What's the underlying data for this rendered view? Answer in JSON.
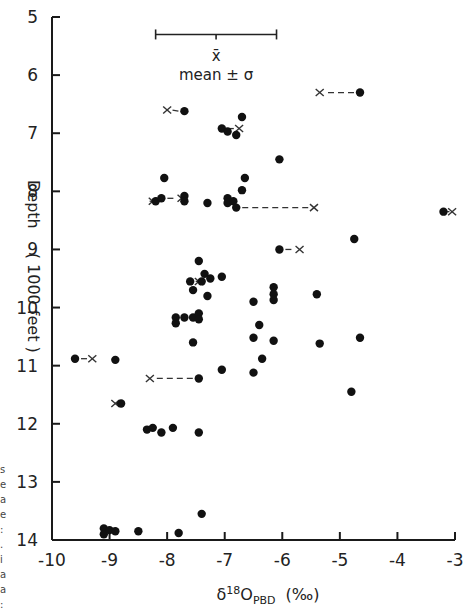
{
  "chart_data": {
    "type": "scatter",
    "title": "",
    "xlabel": "δ18O PBD (‰)",
    "xlabel_parts": {
      "delta": "δ",
      "sup": "18",
      "base": "O",
      "sub": "PBD",
      "unit": "(‰)"
    },
    "ylabel": "Depth (1000 feet)",
    "ylabel_parts": {
      "word": "Depth",
      "unit": "( 1000 feet )"
    },
    "xlim": [
      -10,
      -3
    ],
    "ylim": [
      5,
      14
    ],
    "y_inverted": true,
    "grid": false,
    "x_ticks": [
      -10,
      -9,
      -8,
      -7,
      -6,
      -5,
      -4,
      -3
    ],
    "x_tick_labels": [
      "-10",
      "-9",
      "-8",
      "-7",
      "-6",
      "-5",
      "-4",
      "-3"
    ],
    "y_ticks": [
      5,
      6,
      7,
      8,
      9,
      10,
      11,
      12,
      13,
      14
    ],
    "y_tick_labels": [
      "5",
      "6",
      "7",
      "8",
      "9",
      "10",
      "11",
      "12",
      "13",
      "14"
    ],
    "legend": {
      "mean_symbol": "x̄",
      "label": "mean ± σ",
      "bar_x_range": [
        -8.2,
        -6.1
      ],
      "bar_mean": -7.15,
      "bar_depth": 5.3
    },
    "series": [
      {
        "name": "measured",
        "marker": "filled-circle",
        "points": [
          [
            -7.7,
            6.62
          ],
          [
            -4.65,
            6.3
          ],
          [
            -7.05,
            6.92
          ],
          [
            -6.95,
            6.97
          ],
          [
            -6.8,
            7.03
          ],
          [
            -6.7,
            6.72
          ],
          [
            -6.05,
            7.45
          ],
          [
            -8.05,
            7.77
          ],
          [
            -6.65,
            7.77
          ],
          [
            -6.7,
            7.98
          ],
          [
            -8.2,
            8.17
          ],
          [
            -8.1,
            8.12
          ],
          [
            -7.7,
            8.08
          ],
          [
            -7.7,
            8.17
          ],
          [
            -7.3,
            8.2
          ],
          [
            -6.95,
            8.12
          ],
          [
            -6.95,
            8.2
          ],
          [
            -6.85,
            8.17
          ],
          [
            -6.8,
            8.28
          ],
          [
            -3.2,
            8.35
          ],
          [
            -6.05,
            9.0
          ],
          [
            -4.75,
            8.82
          ],
          [
            -7.45,
            9.2
          ],
          [
            -7.35,
            9.42
          ],
          [
            -7.25,
            9.5
          ],
          [
            -7.05,
            9.47
          ],
          [
            -7.4,
            9.55
          ],
          [
            -7.6,
            9.55
          ],
          [
            -7.55,
            9.7
          ],
          [
            -7.3,
            9.8
          ],
          [
            -6.5,
            9.9
          ],
          [
            -6.15,
            9.65
          ],
          [
            -6.15,
            9.77
          ],
          [
            -6.15,
            9.87
          ],
          [
            -5.4,
            9.77
          ],
          [
            -7.85,
            10.17
          ],
          [
            -7.85,
            10.27
          ],
          [
            -7.7,
            10.17
          ],
          [
            -7.55,
            10.17
          ],
          [
            -7.45,
            10.1
          ],
          [
            -7.45,
            10.2
          ],
          [
            -6.4,
            10.3
          ],
          [
            -7.55,
            10.6
          ],
          [
            -6.5,
            10.52
          ],
          [
            -6.15,
            10.57
          ],
          [
            -5.35,
            10.62
          ],
          [
            -4.65,
            10.52
          ],
          [
            -7.05,
            11.07
          ],
          [
            -6.5,
            11.12
          ],
          [
            -6.35,
            10.88
          ],
          [
            -9.6,
            10.88
          ],
          [
            -8.9,
            10.9
          ],
          [
            -7.45,
            11.22
          ],
          [
            -4.8,
            11.45
          ],
          [
            -8.8,
            11.65
          ],
          [
            -8.35,
            12.1
          ],
          [
            -8.25,
            12.07
          ],
          [
            -8.1,
            12.15
          ],
          [
            -7.9,
            12.07
          ],
          [
            -7.45,
            12.15
          ],
          [
            -7.4,
            13.55
          ],
          [
            -9.1,
            13.8
          ],
          [
            -9.1,
            13.9
          ],
          [
            -9.0,
            13.83
          ],
          [
            -8.9,
            13.85
          ],
          [
            -8.5,
            13.85
          ],
          [
            -7.8,
            13.88
          ]
        ]
      },
      {
        "name": "corrected (x) linked to measured by dashed line",
        "marker": "x",
        "links": [
          {
            "from": [
              -7.7,
              6.62
            ],
            "to": [
              -8.0,
              6.6
            ]
          },
          {
            "from": [
              -4.65,
              6.3
            ],
            "to": [
              -5.35,
              6.3
            ]
          },
          {
            "from": [
              -7.05,
              6.92
            ],
            "to": [
              -6.75,
              6.92
            ]
          },
          {
            "from": [
              -8.1,
              8.12
            ],
            "to": [
              -7.75,
              8.12
            ]
          },
          {
            "from": [
              -8.2,
              8.17
            ],
            "to": [
              -8.25,
              8.17
            ]
          },
          {
            "from": [
              -6.8,
              8.28
            ],
            "to": [
              -5.45,
              8.28
            ]
          },
          {
            "from": [
              -3.2,
              8.35
            ],
            "to": [
              -3.05,
              8.35
            ]
          },
          {
            "from": [
              -6.05,
              9.0
            ],
            "to": [
              -5.7,
              9.0
            ]
          },
          {
            "from": [
              -7.4,
              9.55
            ],
            "to": [
              -7.45,
              9.55
            ]
          },
          {
            "from": [
              -9.6,
              10.88
            ],
            "to": [
              -9.3,
              10.88
            ]
          },
          {
            "from": [
              -7.45,
              11.22
            ],
            "to": [
              -8.3,
              11.22
            ]
          },
          {
            "from": [
              -8.8,
              11.65
            ],
            "to": [
              -8.9,
              11.65
            ]
          }
        ]
      }
    ]
  },
  "margin_text": [
    "s",
    "e",
    "a",
    "e",
    ":",
    ".",
    "i",
    "a",
    "a",
    ":"
  ]
}
